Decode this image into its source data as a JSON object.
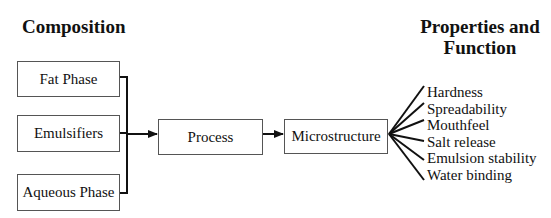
{
  "headings": {
    "composition": "Composition",
    "properties": "Properties and Function"
  },
  "inputs": [
    {
      "label": "Fat Phase"
    },
    {
      "label": "Emulsifiers"
    },
    {
      "label": "Aqueous Phase"
    }
  ],
  "process": {
    "label": "Process"
  },
  "microstructure": {
    "label": "Microstructure"
  },
  "properties": [
    {
      "label": "Hardness"
    },
    {
      "label": "Spreadability"
    },
    {
      "label": "Mouthfeel"
    },
    {
      "label": "Salt release"
    },
    {
      "label": "Emulsion stability"
    },
    {
      "label": "Water binding"
    }
  ],
  "colors": {
    "line": "#111111",
    "box_border": "#555555",
    "background": "#ffffff"
  }
}
